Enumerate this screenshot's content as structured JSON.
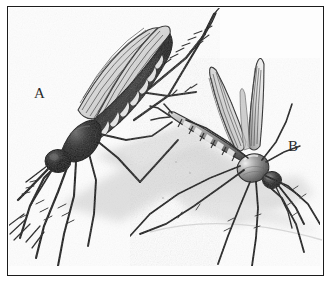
{
  "plate": {
    "title": "Two mosquitoes, comparative illustration plate",
    "medium": "black-and-white engraving / stipple drawing",
    "background_color": "#fdfdfd",
    "frame_color": "#1c1c1c",
    "ink_color": "#1a1a1a",
    "shadow_color": "#bfbfbf"
  },
  "labels": {
    "a": "A",
    "b": "B"
  },
  "figures": [
    {
      "id": "mosquito-a",
      "label": "A",
      "position": "upper-left",
      "posture": "body angled up to the right, head low at lower-left, proboscis pointing down-left",
      "body_tone": "very dark, near black thorax and head",
      "abdomen": "dark with pale crescent bands along the lower edge",
      "wings": "two long narrow wings folded back over abdomen, finely striped with veins",
      "legs": "six long slender legs; two raised and extended to the upper right with spiky hairs; several splayed down to the lower left",
      "shadow": "soft grey cast shadow to the lower right"
    },
    {
      "id": "mosquito-b",
      "label": "B",
      "position": "right of centre, lower",
      "posture": "head low at right, abdomen raised up and to the left at a steep angle",
      "body_tone": "mid grey thorax with highlight, darker head",
      "abdomen": "clearly segmented with alternating pale and dark bands",
      "wings": "two wings held up and spread in a V above the thorax, finely striped with veins",
      "legs": "six long slender legs; long hind legs sweeping down and right to the plate edge",
      "shadow": "soft grey cast shadow beneath running to the right"
    }
  ]
}
